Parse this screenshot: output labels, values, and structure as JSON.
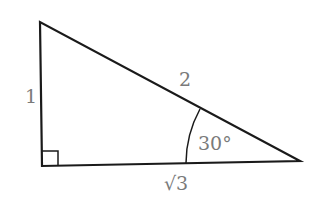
{
  "diagram": {
    "type": "right-triangle",
    "vertices": {
      "top": [
        40,
        22
      ],
      "right_angle": [
        42,
        166
      ],
      "acute": [
        300,
        161
      ]
    },
    "line_color": "#1a1a1a",
    "label_color": "#7a7a7a",
    "labels": {
      "short_leg": "1",
      "hypotenuse": "2",
      "long_leg": "√3",
      "angle": "30°"
    }
  }
}
